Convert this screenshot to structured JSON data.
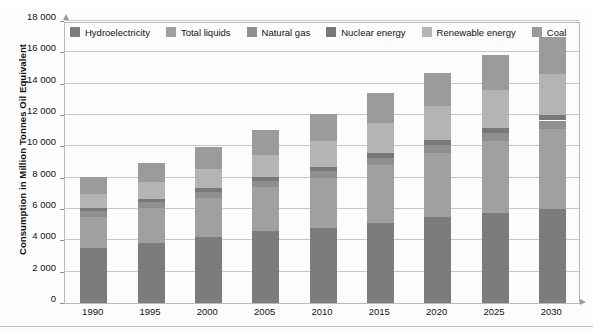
{
  "chart_data": {
    "type": "bar",
    "stacked": true,
    "title": "",
    "xlabel": "",
    "ylabel": "Consumption in Million Tonnes Oil Equivalent",
    "categories": [
      "1990",
      "1995",
      "2000",
      "2005",
      "2010",
      "2015",
      "2020",
      "2025",
      "2030"
    ],
    "ylim": [
      0,
      18000
    ],
    "ytick_step": 2000,
    "ytick_labels": [
      "0",
      "2 000",
      "4 000",
      "6 000",
      "8 000",
      "10 000",
      "12 000",
      "14 000",
      "16 000",
      "18 000"
    ],
    "ytick_values": [
      0,
      2000,
      4000,
      6000,
      8000,
      10000,
      12000,
      14000,
      16000,
      18000
    ],
    "grid": true,
    "legend_position": "top-inside",
    "series": [
      {
        "name": "Hydroelectricity",
        "color": "#7c7c7c",
        "values": [
          3500,
          3850,
          4200,
          4600,
          4800,
          5100,
          5500,
          5750,
          6000
        ]
      },
      {
        "name": "Total liquids",
        "color": "#a0a0a0",
        "values": [
          2000,
          2200,
          2500,
          2800,
          3200,
          3700,
          4100,
          4600,
          5100
        ]
      },
      {
        "name": "Natural gas",
        "color": "#8f8f8f",
        "values": [
          350,
          380,
          400,
          420,
          450,
          480,
          500,
          520,
          550
        ]
      },
      {
        "name": "Nuclear energy",
        "color": "#787878",
        "values": [
          200,
          220,
          240,
          250,
          260,
          280,
          300,
          320,
          340
        ]
      },
      {
        "name": "Renewable energy",
        "color": "#b4b4b4",
        "values": [
          900,
          1050,
          1200,
          1400,
          1600,
          1900,
          2200,
          2400,
          2600
        ]
      },
      {
        "name": "Coal",
        "color": "#9b9b9b",
        "values": [
          1100,
          1250,
          1400,
          1600,
          1750,
          1950,
          2100,
          2250,
          2400
        ]
      }
    ],
    "totals": [
      8050,
      8650,
      9400,
      10850,
      12000,
      13450,
      14700,
      15800,
      16500
    ],
    "colors": {
      "grid": "#c6c6c6",
      "axis": "#b9b9b9",
      "text": "#111111",
      "background": "#fcfcfc"
    }
  },
  "legend": {
    "items": [
      {
        "label": "Hydroelectricity",
        "color": "#7c7c7c"
      },
      {
        "label": "Total liquids",
        "color": "#a0a0a0"
      },
      {
        "label": "Natural gas",
        "color": "#8f8f8f"
      },
      {
        "label": "Nuclear energy",
        "color": "#787878"
      },
      {
        "label": "Renewable energy",
        "color": "#b4b4b4"
      },
      {
        "label": "Coal",
        "color": "#9b9b9b"
      }
    ]
  },
  "axes": {
    "y_title": "Consumption in Million Tonnes Oil Equivalent"
  }
}
